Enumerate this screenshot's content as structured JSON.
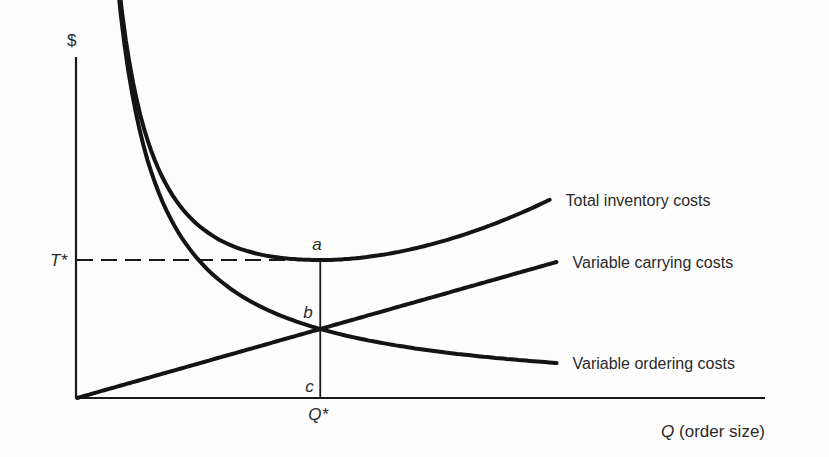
{
  "chart_data": {
    "type": "line",
    "title": "",
    "ylabel": "$",
    "xlabel_var": "Q",
    "xlabel_rest": " (order size)",
    "x_domain": [
      0,
      10
    ],
    "y_domain": [
      0,
      10
    ],
    "optimum": {
      "q": 3.5,
      "total": 4.0,
      "component": 2.0
    },
    "annotations": {
      "a": "a",
      "b": "b",
      "c": "c",
      "t_star": "T*",
      "q_star": "Q*"
    },
    "series": [
      {
        "name": "Total inventory costs",
        "kind": "total",
        "x_start": 0.6,
        "x_end": 6.8
      },
      {
        "name": "Variable carrying costs",
        "kind": "carrying",
        "x_start": 0.0,
        "x_end": 6.9
      },
      {
        "name": "Variable ordering costs",
        "kind": "ordering",
        "x_start": 0.3,
        "x_end": 6.9
      }
    ]
  }
}
